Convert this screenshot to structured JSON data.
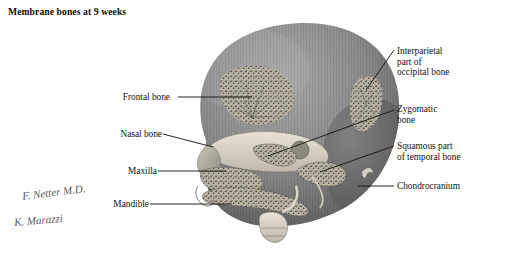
{
  "plate": {
    "title": "Membrane bones at 9 weeks",
    "background_color": "#ffffff",
    "ink_color": "#111111",
    "cranium_color": "#8a8a8a",
    "cranium_dark": "#5f5f5f",
    "bone_color": "#d9d4c8",
    "bone_speckle": "#4e4c46"
  },
  "labels_left": [
    {
      "id": "frontal-bone",
      "text": "Frontal bone",
      "x": 168,
      "y": 100
    },
    {
      "id": "nasal-bone",
      "text": "Nasal bone",
      "x": 160,
      "y": 137
    },
    {
      "id": "maxilla",
      "text": "Maxilla",
      "x": 155,
      "y": 174
    },
    {
      "id": "mandible",
      "text": "Mandible",
      "x": 147,
      "y": 207
    }
  ],
  "labels_right": [
    {
      "id": "interparietal-occipital",
      "text": "Interparietal\npart of\noccipital bone",
      "x": 397,
      "y": 46
    },
    {
      "id": "zygomatic-bone",
      "text": "Zygomatic\nbone",
      "x": 397,
      "y": 105
    },
    {
      "id": "squamous-temporal",
      "text": "Squamous part\nof temporal bone",
      "x": 397,
      "y": 142
    },
    {
      "id": "chondrocranium",
      "text": "Chondrocranium",
      "x": 397,
      "y": 182
    }
  ],
  "signatures": [
    {
      "id": "netter-signature",
      "text": "F. Netter M.D.",
      "x": 22,
      "y": 190
    },
    {
      "id": "marazzi-signature",
      "text": "K. Marazzi",
      "x": 14,
      "y": 218
    }
  ]
}
